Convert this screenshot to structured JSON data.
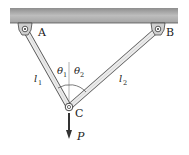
{
  "diagram": {
    "type": "two-bar truss / cable support",
    "ceiling": {
      "color_top": "#9a9a9a",
      "color_bottom": "#c8c8c8"
    },
    "supports": [
      {
        "id": "A",
        "label": "A",
        "x": 25,
        "y": 29
      },
      {
        "id": "B",
        "label": "B",
        "x": 158,
        "y": 29
      }
    ],
    "joint": {
      "id": "C",
      "label": "C",
      "x": 69,
      "y": 107
    },
    "members": [
      {
        "id": "l1",
        "label": "l",
        "subscript": "1",
        "from": "A",
        "to": "C"
      },
      {
        "id": "l2",
        "label": "l",
        "subscript": "2",
        "from": "B",
        "to": "C"
      }
    ],
    "angles": [
      {
        "id": "theta1",
        "label": "θ",
        "subscript": "1"
      },
      {
        "id": "theta2",
        "label": "θ",
        "subscript": "2"
      }
    ],
    "load": {
      "label": "P",
      "direction": "down"
    }
  }
}
